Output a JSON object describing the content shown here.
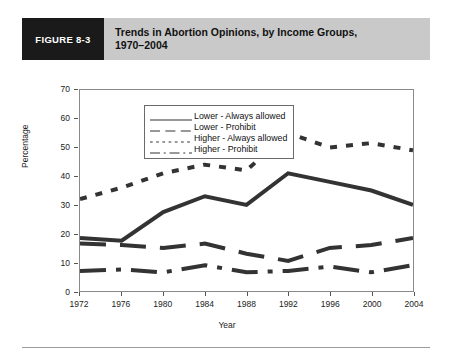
{
  "figure": {
    "badge": "FIGURE 8-3",
    "title_line1": "Trends in Abortion Opinions, by Income Groups,",
    "title_line2": "1970–2004"
  },
  "colors": {
    "badge_bg": "#1a1a1a",
    "titlebar_bg": "#c9c9c9",
    "line": "#333333",
    "frame": "#8a8a8a",
    "rule": "#9a9a9a"
  },
  "chart_data": {
    "type": "line",
    "title": "Trends in Abortion Opinions, by Income Groups, 1970–2004",
    "xlabel": "Year",
    "ylabel": "Percentage",
    "categories": [
      1972,
      1976,
      1980,
      1984,
      1988,
      1992,
      1996,
      2000,
      2004
    ],
    "x_tick_labels": [
      "1972",
      "1976",
      "1980",
      "1984",
      "1988",
      "1992",
      "1996",
      "2000",
      "2004"
    ],
    "y_tick_labels": [
      "0",
      "10",
      "20",
      "30",
      "40",
      "50",
      "60",
      "70"
    ],
    "ylim": [
      0,
      70
    ],
    "y_step": 10,
    "grid": false,
    "legend_position": "top-left-inside",
    "series": [
      {
        "name": "Lower - Always allowed",
        "style": "solid",
        "values": [
          18.5,
          17.5,
          27.5,
          33.0,
          30.0,
          41.0,
          38.0,
          35.0,
          30.0
        ]
      },
      {
        "name": "Lower - Prohibit",
        "style": "dashed",
        "values": [
          16.5,
          16.0,
          15.0,
          16.5,
          13.0,
          10.5,
          15.0,
          16.0,
          18.5
        ]
      },
      {
        "name": "Higher - Always allowed",
        "style": "dotted",
        "values": [
          32.0,
          36.0,
          41.0,
          44.0,
          42.0,
          55.0,
          50.0,
          51.5,
          49.0
        ]
      },
      {
        "name": "Higher - Prohibit",
        "style": "dashdot",
        "values": [
          7.0,
          7.5,
          6.5,
          9.0,
          6.5,
          7.0,
          8.5,
          6.5,
          9.0
        ]
      }
    ]
  }
}
